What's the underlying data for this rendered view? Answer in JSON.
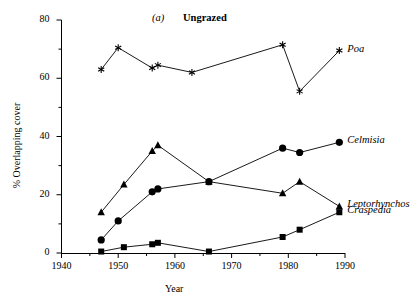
{
  "panel": {
    "letter": "(a)",
    "title": "Ungrazed"
  },
  "axes": {
    "x_title": "Year",
    "y_title": "% Overlapping cover",
    "x_ticks": [
      "1940",
      "1950",
      "1960",
      "1970",
      "1980",
      "1990"
    ],
    "y_ticks": [
      "0",
      "20",
      "40",
      "60",
      "80"
    ]
  },
  "labels": {
    "poa": "Poa",
    "celmisia": "Celmisia",
    "leptorhynchos": "Leptorhynchos",
    "craspedia": "Craspedia"
  },
  "chart_data": {
    "type": "line",
    "title": "(a)  Ungrazed",
    "xlabel": "Year",
    "ylabel": "% Overlapping cover",
    "xlim": [
      1940,
      1990
    ],
    "ylim": [
      0,
      80
    ],
    "x_major_ticks": [
      1940,
      1950,
      1960,
      1970,
      1980,
      1990
    ],
    "y_major_ticks": [
      0,
      20,
      40,
      60,
      80
    ],
    "x_minor_step": 5,
    "y_minor_step": 10,
    "grid": false,
    "legend": "inline-right-of-line-end",
    "series": [
      {
        "name": "Poa",
        "marker": "asterisk",
        "x": [
          1947,
          1950,
          1956,
          1957,
          1963,
          1979,
          1982,
          1989
        ],
        "values": [
          63,
          70.5,
          63.5,
          64.5,
          62,
          71.5,
          55.5,
          69.5
        ]
      },
      {
        "name": "Celmisia",
        "marker": "filled-circle",
        "x": [
          1947,
          1950,
          1956,
          1957,
          1966,
          1979,
          1982,
          1989
        ],
        "values": [
          4.5,
          11,
          21,
          22,
          24.5,
          36,
          34.5,
          38
        ]
      },
      {
        "name": "Leptorhynchos",
        "marker": "filled-triangle",
        "x": [
          1947,
          1951,
          1956,
          1957,
          1966,
          1979,
          1982,
          1989
        ],
        "values": [
          14,
          23.5,
          35,
          37,
          24.5,
          20.5,
          24.5,
          16
        ]
      },
      {
        "name": "Craspedia",
        "marker": "filled-square",
        "x": [
          1947,
          1951,
          1956,
          1957,
          1966,
          1979,
          1982,
          1989
        ],
        "values": [
          0.5,
          2,
          3,
          3.5,
          0.5,
          5.5,
          8,
          14
        ]
      }
    ]
  }
}
